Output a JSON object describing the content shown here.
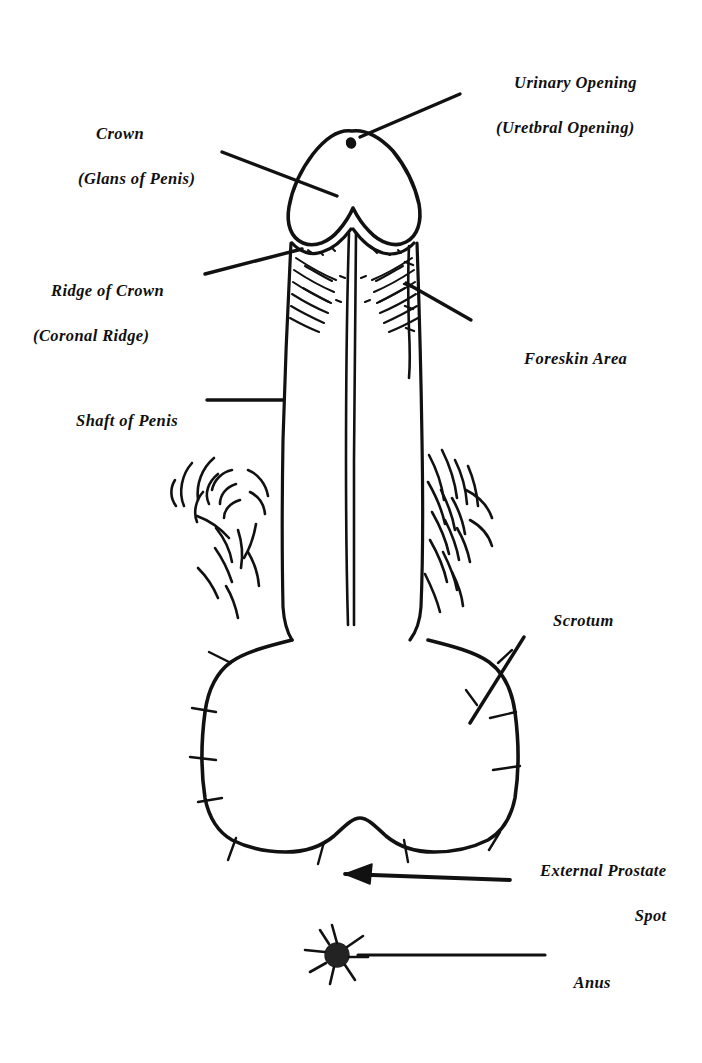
{
  "figure": {
    "kind": "line-drawing",
    "ink_color": "#111111",
    "background_color": "#ffffff"
  },
  "labels": {
    "urinary_opening": {
      "line1": "Urinary Opening",
      "line2": "(Uretbral Opening)",
      "align": "left"
    },
    "crown": {
      "line1": "Crown",
      "line2": "(Glans of Penis)",
      "align": "left"
    },
    "ridge_of_crown": {
      "line1": "Ridge of Crown",
      "line2": "(Coronal Ridge)",
      "align": "left"
    },
    "foreskin_area": {
      "line1": "Foreskin Area",
      "line2": "",
      "align": "left"
    },
    "shaft_of_penis": {
      "line1": "Shaft of Penis",
      "line2": "",
      "align": "left"
    },
    "scrotum": {
      "line1": "Scrotum",
      "line2": "",
      "align": "left"
    },
    "external_prostate_spot": {
      "line1": "External Prostate",
      "line2": "Spot",
      "align": "right"
    },
    "anus": {
      "line1": "Anus",
      "line2": "",
      "align": "left"
    }
  }
}
